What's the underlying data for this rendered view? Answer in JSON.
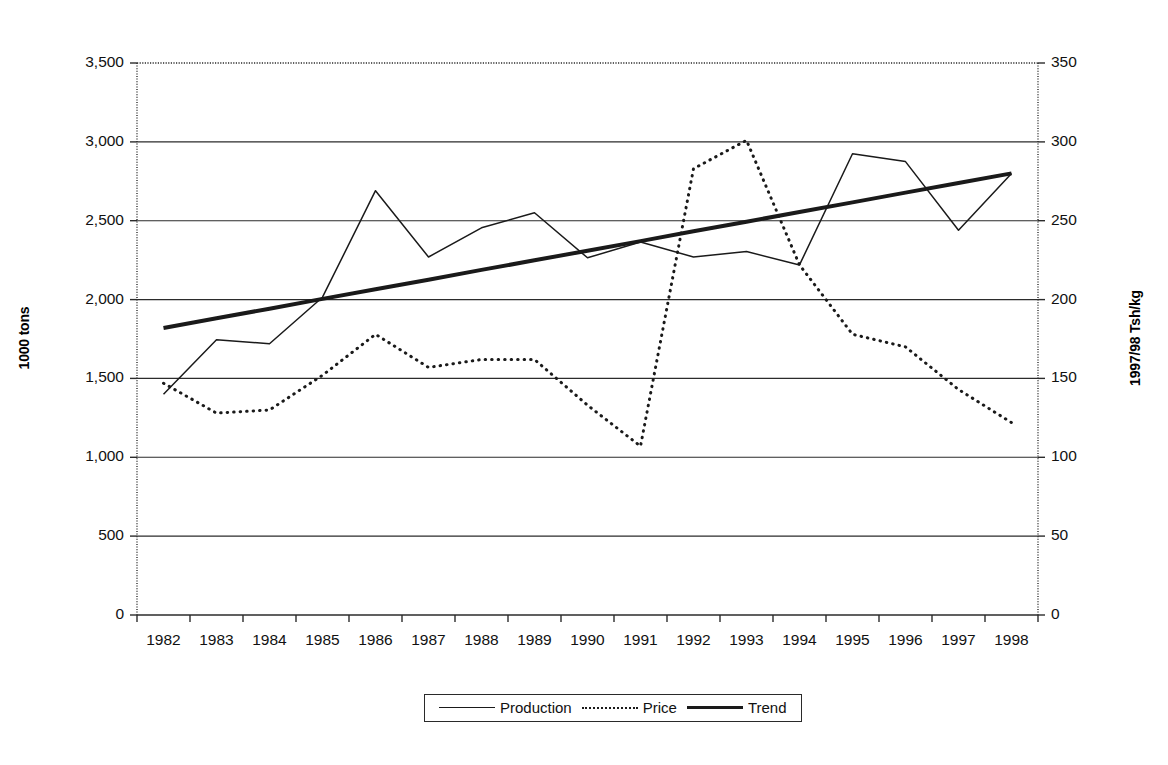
{
  "chart_data": {
    "type": "line",
    "title": "",
    "xlabel": "",
    "ylabel": "1000 tons",
    "y2label": "1997/98 Tsh/kg",
    "grid": true,
    "legend_position": "bottom",
    "x": [
      1982,
      1983,
      1984,
      1985,
      1986,
      1987,
      1988,
      1989,
      1990,
      1991,
      1992,
      1993,
      1994,
      1995,
      1996,
      1997,
      1998
    ],
    "categories": [
      "1982",
      "1983",
      "1984",
      "1985",
      "1986",
      "1987",
      "1988",
      "1989",
      "1990",
      "1991",
      "1992",
      "1993",
      "1994",
      "1995",
      "1996",
      "1997",
      "1998"
    ],
    "ylim": [
      0,
      3500
    ],
    "y2lim": [
      0,
      350
    ],
    "yticks": [
      0,
      500,
      1000,
      1500,
      2000,
      2500,
      3000,
      3500
    ],
    "ytick_labels": [
      "0",
      "500",
      "1,000",
      "1,500",
      "2,000",
      "2,500",
      "3,000",
      "3,500"
    ],
    "y2ticks": [
      0,
      50,
      100,
      150,
      200,
      250,
      300,
      350
    ],
    "y2tick_labels": [
      "0",
      "50",
      "100",
      "150",
      "200",
      "250",
      "300",
      "350"
    ],
    "series": [
      {
        "name": "Production",
        "axis": "left",
        "style": "solid-thin",
        "units": "1000 tons",
        "values": [
          1400,
          1745,
          1720,
          2015,
          2690,
          2270,
          2455,
          2550,
          2265,
          2365,
          2270,
          2305,
          2220,
          2925,
          2875,
          2440,
          2800
        ]
      },
      {
        "name": "Price",
        "axis": "right",
        "style": "dotted",
        "units": "1997/98 Tsh/kg",
        "values": [
          147,
          128,
          130,
          152,
          178,
          157,
          162,
          162,
          133,
          107,
          283,
          301,
          222,
          178,
          170,
          143,
          122
        ]
      },
      {
        "name": "Trend",
        "axis": "left",
        "style": "solid-thick",
        "units": "1000 tons",
        "values": [
          1820,
          1881,
          1942,
          2004,
          2065,
          2126,
          2188,
          2249,
          2310,
          2371,
          2433,
          2494,
          2555,
          2616,
          2678,
          2739,
          2800
        ]
      }
    ],
    "legend": [
      "Production",
      "Price",
      "Trend"
    ]
  },
  "legend": {
    "items": [
      {
        "label": "Production",
        "swatch": "solid-thin-line-swatch"
      },
      {
        "label": "Price",
        "swatch": "dotted-line-swatch"
      },
      {
        "label": "Trend",
        "swatch": "solid-thick-line-swatch"
      }
    ]
  },
  "axes": {
    "left_title": "1000 tons",
    "right_title": "1997/98 Tsh/kg"
  }
}
